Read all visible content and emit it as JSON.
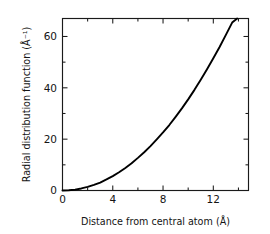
{
  "chart_data": {
    "type": "line",
    "title": "",
    "xlabel": "Distance from central atom (Å)",
    "ylabel": "Radial distribution function (Å⁻¹)",
    "xlim": [
      0,
      14.8
    ],
    "ylim": [
      0,
      67
    ],
    "grid": false,
    "legend": null,
    "x_ticks_major": [
      0,
      4,
      8,
      12
    ],
    "x_tick_labels": [
      "0",
      "4",
      "8",
      "12"
    ],
    "x_ticks_minor": [
      2,
      6,
      10,
      14
    ],
    "y_ticks_major": [
      0,
      20,
      40,
      60
    ],
    "y_tick_labels": [
      "0",
      "20",
      "40",
      "60"
    ],
    "y_ticks_minor": [
      10,
      30,
      50
    ],
    "series": [
      {
        "name": "radial distribution function",
        "color": "#000000",
        "x": [
          0.0,
          0.5,
          1.0,
          1.5,
          2.0,
          2.5,
          3.0,
          3.5,
          4.0,
          4.5,
          5.0,
          5.5,
          6.0,
          6.5,
          7.0,
          7.5,
          8.0,
          8.5,
          9.0,
          9.5,
          10.0,
          10.5,
          11.0,
          11.5,
          12.0,
          12.5,
          13.0,
          13.5,
          13.9
        ],
        "y": [
          0.0,
          0.1,
          0.35,
          0.8,
          1.4,
          2.2,
          3.1,
          4.3,
          5.6,
          7.1,
          8.8,
          10.6,
          12.7,
          14.9,
          17.3,
          19.9,
          22.6,
          25.5,
          28.7,
          32.0,
          35.5,
          39.2,
          43.1,
          47.2,
          51.5,
          55.9,
          60.6,
          65.4,
          67.0
        ]
      }
    ]
  },
  "axes": {
    "x_axis_label": "Distance from central atom (Å)",
    "y_axis_label": "Radial distribution function (Å⁻¹)"
  }
}
